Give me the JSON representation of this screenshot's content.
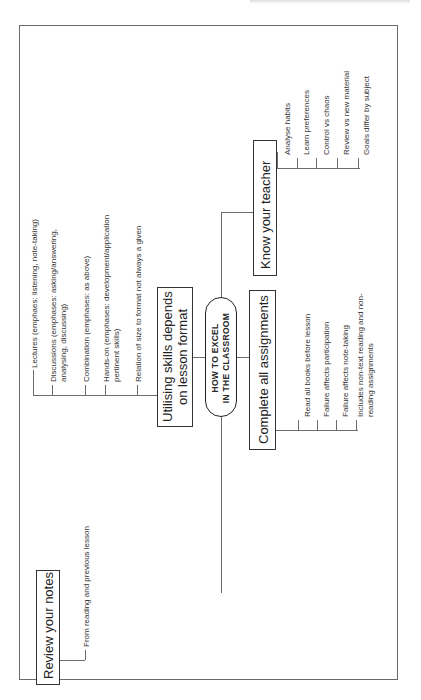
{
  "diagram": {
    "type": "mind-map",
    "orientation": "rotated-90-ccw",
    "center": {
      "line1": "HOW TO EXCEL",
      "line2": "IN THE CLASSROOM"
    },
    "branches": [
      {
        "id": "lesson-format",
        "title_line1": "Utilising skills depends",
        "title_line2": "on lesson format",
        "items": [
          {
            "text": "Lectures (emphaes: listening, note-taking)"
          },
          {
            "text": "Discussions (emphases: asking/answering,",
            "text2": "analysing, discussing)"
          },
          {
            "text": "Combination (emphases: as above)"
          },
          {
            "text": "Hands-on (emphases: development/application",
            "text2": "pertinent skills)"
          },
          {
            "text": "Relation of size to format not always a given"
          }
        ]
      },
      {
        "id": "know-teacher",
        "title": "Know your teacher",
        "items": [
          {
            "text": "Analyse habits"
          },
          {
            "text": "Learn preferences"
          },
          {
            "text": "Control vs chaos"
          },
          {
            "text": "Review vs new material"
          },
          {
            "text": "Goals differ by subject"
          }
        ]
      },
      {
        "id": "assignments",
        "title": "Complete all assignments",
        "items": [
          {
            "text": "Read all books before lesson"
          },
          {
            "text": "Failure affects participation"
          },
          {
            "text": "Failure affects note-taking"
          },
          {
            "text": "Includes non-text reading and non-",
            "text2": "reading assignments"
          }
        ]
      },
      {
        "id": "review-notes",
        "title": "Review your notes",
        "items": [
          {
            "text": "From reading and previous lesson"
          }
        ]
      }
    ]
  },
  "colors": {
    "line": "#6d6d6d",
    "border": "#333333",
    "text": "#2a2a2a",
    "background": "#ffffff"
  }
}
